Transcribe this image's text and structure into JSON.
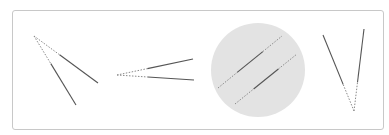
{
  "colors": {
    "frame_border": "#c8c8c8",
    "line": "#555555",
    "dashed_line": "#8a8a8a",
    "circle_fill": "#e3e3e3",
    "background": "#ffffff"
  },
  "figures": [
    {
      "id": "angle-1",
      "label": "Angle with vertex at upper-left, two rays opening downward-right",
      "vertex": [
        34,
        36
      ],
      "rays": [
        {
          "end": [
            98,
            83
          ],
          "dashed_fraction": 0.4
        },
        {
          "end": [
            76,
            105
          ],
          "dashed_fraction": 0.4
        }
      ]
    },
    {
      "id": "angle-2",
      "label": "Narrow angle with vertex at left, two rays opening to the right",
      "vertex": [
        117,
        75
      ],
      "rays": [
        {
          "end": [
            193,
            59
          ],
          "dashed_fraction": 0.4
        },
        {
          "end": [
            194,
            80
          ],
          "dashed_fraction": 0.4
        }
      ]
    },
    {
      "id": "parallel-lines-in-circle",
      "label": "Two parallel diagonal lines inside a gray circle",
      "circle": {
        "cx": 258,
        "cy": 70,
        "r": 47
      },
      "lines": [
        {
          "start": [
            218,
            88
          ],
          "end": [
            282,
            36
          ]
        },
        {
          "start": [
            235,
            104
          ],
          "end": [
            297,
            54
          ]
        }
      ]
    },
    {
      "id": "angle-3",
      "label": "V-shaped angle with vertex at bottom",
      "vertex": [
        354,
        111
      ],
      "rays": [
        {
          "end": [
            323,
            35
          ],
          "dashed_fraction": 0.35
        },
        {
          "end": [
            364,
            29
          ],
          "dashed_fraction": 0.35
        }
      ]
    }
  ],
  "caption": "Geometric figures: angles and parallel lines"
}
